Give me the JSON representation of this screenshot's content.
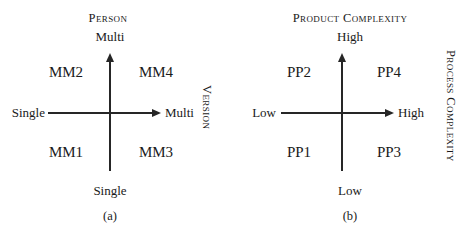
{
  "figure": {
    "panels": [
      {
        "id": "a",
        "caption": "(a)",
        "y_axis_title": "Person",
        "y_axis_top_value": "Multi",
        "y_axis_bottom_value": "Single",
        "x_axis_title": "Version",
        "x_axis_left_value": "Single",
        "x_axis_right_value": "Multi",
        "quadrants": {
          "top_left": "MM2",
          "top_right": "MM4",
          "bottom_left": "MM1",
          "bottom_right": "MM3"
        }
      },
      {
        "id": "b",
        "caption": "(b)",
        "y_axis_title": "Product Complexity",
        "y_axis_top_value": "High",
        "y_axis_bottom_value": "Low",
        "x_axis_title": "Process Complexity",
        "x_axis_left_value": "Low",
        "x_axis_right_value": "High",
        "quadrants": {
          "top_left": "PP2",
          "top_right": "PP4",
          "bottom_left": "PP1",
          "bottom_right": "PP3"
        }
      }
    ],
    "colors": {
      "axis": "#262626",
      "text": "#1a1a1a",
      "background": "#ffffff"
    }
  }
}
